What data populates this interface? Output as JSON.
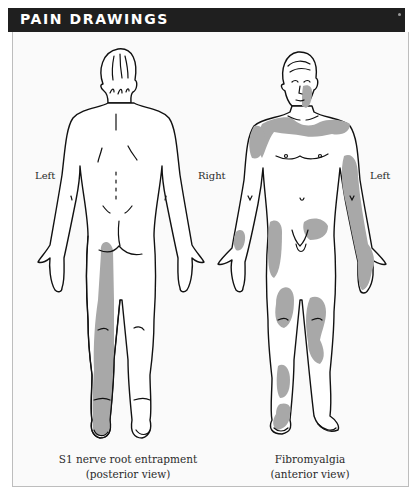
{
  "header": {
    "title": "PAIN DRAWINGS"
  },
  "colors": {
    "header_bg": "#1f1f1f",
    "header_text": "#ffffff",
    "pain_shading": "#a8a8a8",
    "outline": "#111111",
    "panel_border": "#bdbdbd"
  },
  "figures": [
    {
      "id": "posterior",
      "side_labels": {
        "left": "Left",
        "right": "Right"
      },
      "caption_line1": "S1 nerve root entrapment",
      "caption_line2": "(posterior view)",
      "shaded_regions": [
        "left buttock",
        "left posterior thigh",
        "left calf",
        "left heel and sole"
      ]
    },
    {
      "id": "anterior",
      "side_labels": {
        "right": "Right",
        "left": "Left"
      },
      "caption_line1": "Fibromyalgia",
      "caption_line2": "(anterior view)",
      "shaded_regions": [
        "left jaw/neck",
        "shoulders and upper chest",
        "right upper arm",
        "left arm and hand",
        "right forearm",
        "lower abdomen",
        "right outer thigh",
        "both knees",
        "left inner thigh",
        "right shin",
        "right ankle/foot"
      ]
    }
  ],
  "labels": {
    "left_figure_left": "Left",
    "center_right": "Right",
    "right_figure_left": "Left"
  }
}
